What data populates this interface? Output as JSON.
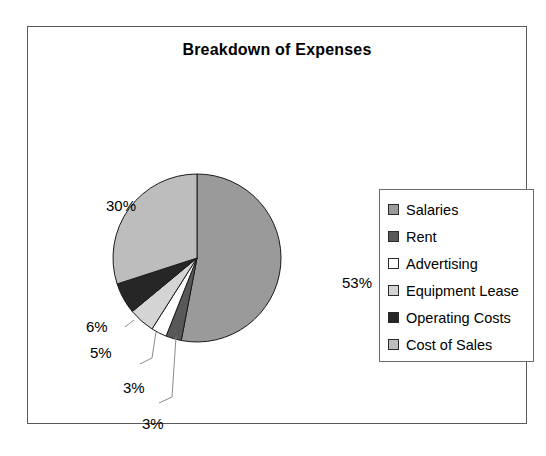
{
  "chart_data": {
    "type": "pie",
    "title": "Breakdown of Expenses",
    "xlabel": "",
    "ylabel": "",
    "legend_position": "right",
    "grid": false,
    "categories": [
      "Salaries",
      "Rent",
      "Advertising",
      "Equipment Lease",
      "Operating Costs",
      "Cost of Sales"
    ],
    "values": [
      53,
      3,
      3,
      5,
      6,
      30
    ],
    "value_labels": [
      "53%",
      "3%",
      "3%",
      "5%",
      "6%",
      "30%"
    ],
    "units": "percent",
    "start_angle_deg": 0,
    "direction": "clockwise",
    "slices": [
      {
        "label": "Salaries",
        "value": 53,
        "display": "53%",
        "color": "#9a9a9a",
        "start_deg": 0,
        "end_deg": 190.8
      },
      {
        "label": "Rent",
        "value": 3,
        "display": "3%",
        "color": "#585858",
        "start_deg": 190.8,
        "end_deg": 201.6
      },
      {
        "label": "Advertising",
        "value": 3,
        "display": "3%",
        "color": "#ffffff",
        "start_deg": 201.6,
        "end_deg": 212.4
      },
      {
        "label": "Equipment Lease",
        "value": 5,
        "display": "5%",
        "color": "#d4d4d4",
        "start_deg": 212.4,
        "end_deg": 230.4
      },
      {
        "label": "Operating Costs",
        "value": 6,
        "display": "6%",
        "color": "#262626",
        "start_deg": 230.4,
        "end_deg": 252.0
      },
      {
        "label": "Cost of Sales",
        "value": 30,
        "display": "30%",
        "color": "#bdbdbd",
        "start_deg": 252.0,
        "end_deg": 360.0
      }
    ]
  },
  "legend": {
    "items": [
      {
        "label": "Salaries",
        "color": "#9a9a9a"
      },
      {
        "label": "Rent",
        "color": "#585858"
      },
      {
        "label": "Advertising",
        "color": "#ffffff"
      },
      {
        "label": "Equipment Lease",
        "color": "#d4d4d4"
      },
      {
        "label": "Operating Costs",
        "color": "#262626"
      },
      {
        "label": "Cost of Sales",
        "color": "#bdbdbd"
      }
    ]
  },
  "style": {
    "frame_border_color": "#5a5a5a",
    "slice_outline_color": "#1a1a1a",
    "leader_line_color": "#8c8c8c",
    "background": "#ffffff",
    "text_color": "#000000"
  }
}
